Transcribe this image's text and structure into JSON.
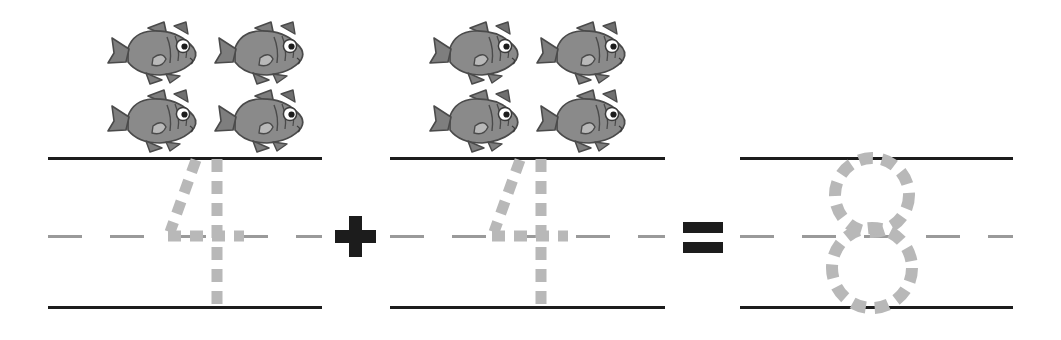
{
  "worksheet": {
    "kind": "addition-equation-with-traceable-numerals",
    "equation_text": "4 + 8 = 8",
    "operands": [
      {
        "numeral": "4",
        "object_count": 4,
        "object_name": "fish"
      },
      {
        "numeral": "4",
        "object_count": 4,
        "object_name": "fish"
      }
    ],
    "operator": "+",
    "relation": "=",
    "result": {
      "numeral": "8",
      "object_count": 8
    }
  },
  "colors": {
    "background": "#ffffff",
    "rule_solid": "#1c1c1c",
    "rule_dashed": "#9a9a9a",
    "trace_stroke": "#b8b8b8",
    "operator": "#1c1c1c",
    "fish_body": "#8a8a8a",
    "fish_body_dark": "#6f6f6f",
    "fish_outline": "#4a4a4a",
    "fish_eye_white": "#ffffff",
    "fish_eye_pupil": "#1c1c1c"
  },
  "groups": [
    {
      "id": "addend-1",
      "label": "first-addend",
      "numeral": "4",
      "fish_count": 4,
      "left": 48,
      "width": 274,
      "top_rule_y": 157,
      "mid_rule_y": 236,
      "bottom_rule_y": 306
    },
    {
      "id": "addend-2",
      "label": "second-addend",
      "numeral": "4",
      "fish_count": 4,
      "left": 390,
      "width": 275,
      "top_rule_y": 157,
      "mid_rule_y": 236,
      "bottom_rule_y": 306
    },
    {
      "id": "sum",
      "label": "sum",
      "numeral": "8",
      "fish_count": 0,
      "left": 740,
      "width": 273,
      "top_rule_y": 157,
      "mid_rule_y": 236,
      "bottom_rule_y": 306
    }
  ],
  "operators": {
    "plus": {
      "symbol": "+",
      "center_x": 355,
      "center_y": 236
    },
    "equals": {
      "symbol": "=",
      "center_x": 703,
      "center_y": 236
    }
  },
  "icons": {
    "fish": "fish-icon",
    "plus": "plus-sign-icon",
    "equals": "equals-sign-icon",
    "trace_four": "traceable-numeral-four",
    "trace_eight": "traceable-numeral-eight"
  }
}
